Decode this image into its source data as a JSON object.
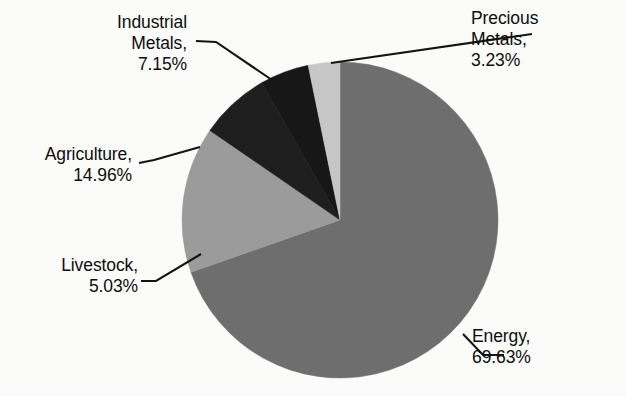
{
  "chart_data": {
    "type": "pie",
    "title": "",
    "categories": [
      "Energy",
      "Agriculture",
      "Industrial Metals",
      "Livestock",
      "Precious Metals"
    ],
    "values": [
      69.63,
      14.96,
      7.15,
      5.03,
      3.23
    ],
    "unit": "%",
    "legend": "none",
    "labels": [
      {
        "name": "Energy",
        "value": 69.63,
        "text_line1": "Energy,",
        "text_line2": "69.63%",
        "color": "#6e6e6e"
      },
      {
        "name": "Agriculture",
        "value": 14.96,
        "text_line1": "Agriculture,",
        "text_line2": "14.96%",
        "color": "#9b9b9b"
      },
      {
        "name": "Industrial Metals",
        "value": 7.15,
        "text_line1": "Industrial",
        "text_line2": "Metals,",
        "text_line3": "7.15%",
        "color": "#1e1e1e"
      },
      {
        "name": "Livestock",
        "value": 5.03,
        "text_line1": "Livestock,",
        "text_line2": "5.03%",
        "color": "#171717"
      },
      {
        "name": "Precious Metals",
        "value": 3.23,
        "text_line1": "Precious",
        "text_line2": "Metals,",
        "text_line3": "3.23%",
        "color": "#c6c6c6"
      }
    ],
    "geometry": {
      "center_x": 340,
      "center_y": 220,
      "radius": 158,
      "start_angle_deg": 0,
      "direction": "clockwise"
    },
    "colors": {
      "energy": "#6e6e6e",
      "agriculture": "#9b9b9b",
      "industrial_metals": "#1e1e1e",
      "livestock": "#171717",
      "precious_metals": "#c6c6c6",
      "leader_line": "#141414",
      "background": "#fbfbfa"
    }
  }
}
